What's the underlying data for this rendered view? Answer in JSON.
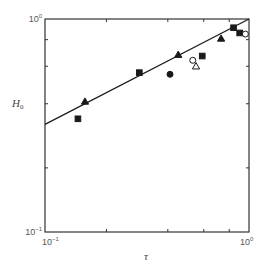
{
  "chart_data": {
    "type": "scatter",
    "title": "",
    "xlabel": "τ",
    "ylabel": "H0",
    "ylabel_main": "H",
    "ylabel_sub": "0",
    "xscale": "log",
    "yscale": "log",
    "xlim": [
      0.1,
      1.0
    ],
    "ylim": [
      0.1,
      1.0
    ],
    "grid": false,
    "legend": null,
    "x_tick_labels": [
      {
        "value": 0.1,
        "base": "10",
        "exp": "−1"
      },
      {
        "value": 1.0,
        "base": "10",
        "exp": "0"
      }
    ],
    "y_tick_labels": [
      {
        "value": 0.1,
        "base": "10",
        "exp": "−1"
      },
      {
        "value": 1.0,
        "base": "10",
        "exp": "0"
      }
    ],
    "minor_ticks": [
      0.2,
      0.4,
      0.6,
      0.8
    ],
    "fit_line": {
      "description": "power-law fit, H0 ≈ τ^0.5",
      "points": [
        {
          "x": 0.1,
          "y": 0.32
        },
        {
          "x": 1.0,
          "y": 1.0
        }
      ]
    },
    "series": [
      {
        "name": "filled-square",
        "marker": "square",
        "filled": true,
        "points": [
          {
            "x": 0.145,
            "y": 0.34
          },
          {
            "x": 0.29,
            "y": 0.56
          },
          {
            "x": 0.59,
            "y": 0.67
          },
          {
            "x": 0.84,
            "y": 0.91
          },
          {
            "x": 0.9,
            "y": 0.86
          }
        ]
      },
      {
        "name": "filled-triangle",
        "marker": "triangle",
        "filled": true,
        "points": [
          {
            "x": 0.157,
            "y": 0.41
          },
          {
            "x": 0.45,
            "y": 0.68
          },
          {
            "x": 0.73,
            "y": 0.81
          }
        ]
      },
      {
        "name": "filled-circle",
        "marker": "circle",
        "filled": true,
        "points": [
          {
            "x": 0.41,
            "y": 0.55
          }
        ]
      },
      {
        "name": "open-circle",
        "marker": "circle",
        "filled": false,
        "points": [
          {
            "x": 0.53,
            "y": 0.64
          },
          {
            "x": 0.96,
            "y": 0.85
          }
        ]
      },
      {
        "name": "open-triangle",
        "marker": "triangle",
        "filled": false,
        "points": [
          {
            "x": 0.55,
            "y": 0.6
          }
        ]
      }
    ]
  },
  "colors": {
    "axis": "#333333",
    "marker": "#1a1a1a",
    "line": "#1a1a1a",
    "text": "#555555"
  }
}
